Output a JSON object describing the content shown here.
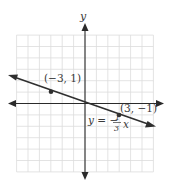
{
  "chart_data": {
    "type": "line",
    "title": "",
    "xlabel": "",
    "ylabel": "y",
    "xlim": [
      -6,
      6
    ],
    "ylim": [
      -6,
      6
    ],
    "grid": true,
    "legend": null,
    "series": [
      {
        "name": "y = -1/3 x",
        "equation": "y = -(1/3)x",
        "slope": -0.3333,
        "intercept": 0,
        "x": [
          -7,
          6
        ],
        "y": [
          2.333,
          -2
        ]
      }
    ],
    "points": [
      {
        "x": -3,
        "y": 1,
        "label": "(−3, 1)"
      },
      {
        "x": 3,
        "y": -1,
        "label": "(3, −1)"
      }
    ],
    "annotations": [
      {
        "text": "y = −1/3 x",
        "near": [
          3,
          -1.5
        ]
      }
    ]
  },
  "labels": {
    "y_axis": "y",
    "point1": "(−3, 1)",
    "point2": "(3, −1)",
    "eq_lhs": "y = −",
    "eq_num": "1",
    "eq_den": "3",
    "eq_var": "x"
  },
  "colors": {
    "grid": "#dcdcdc",
    "axis": "#2a2a2a",
    "line": "#2f2f2f",
    "text": "#3a3a3a"
  }
}
